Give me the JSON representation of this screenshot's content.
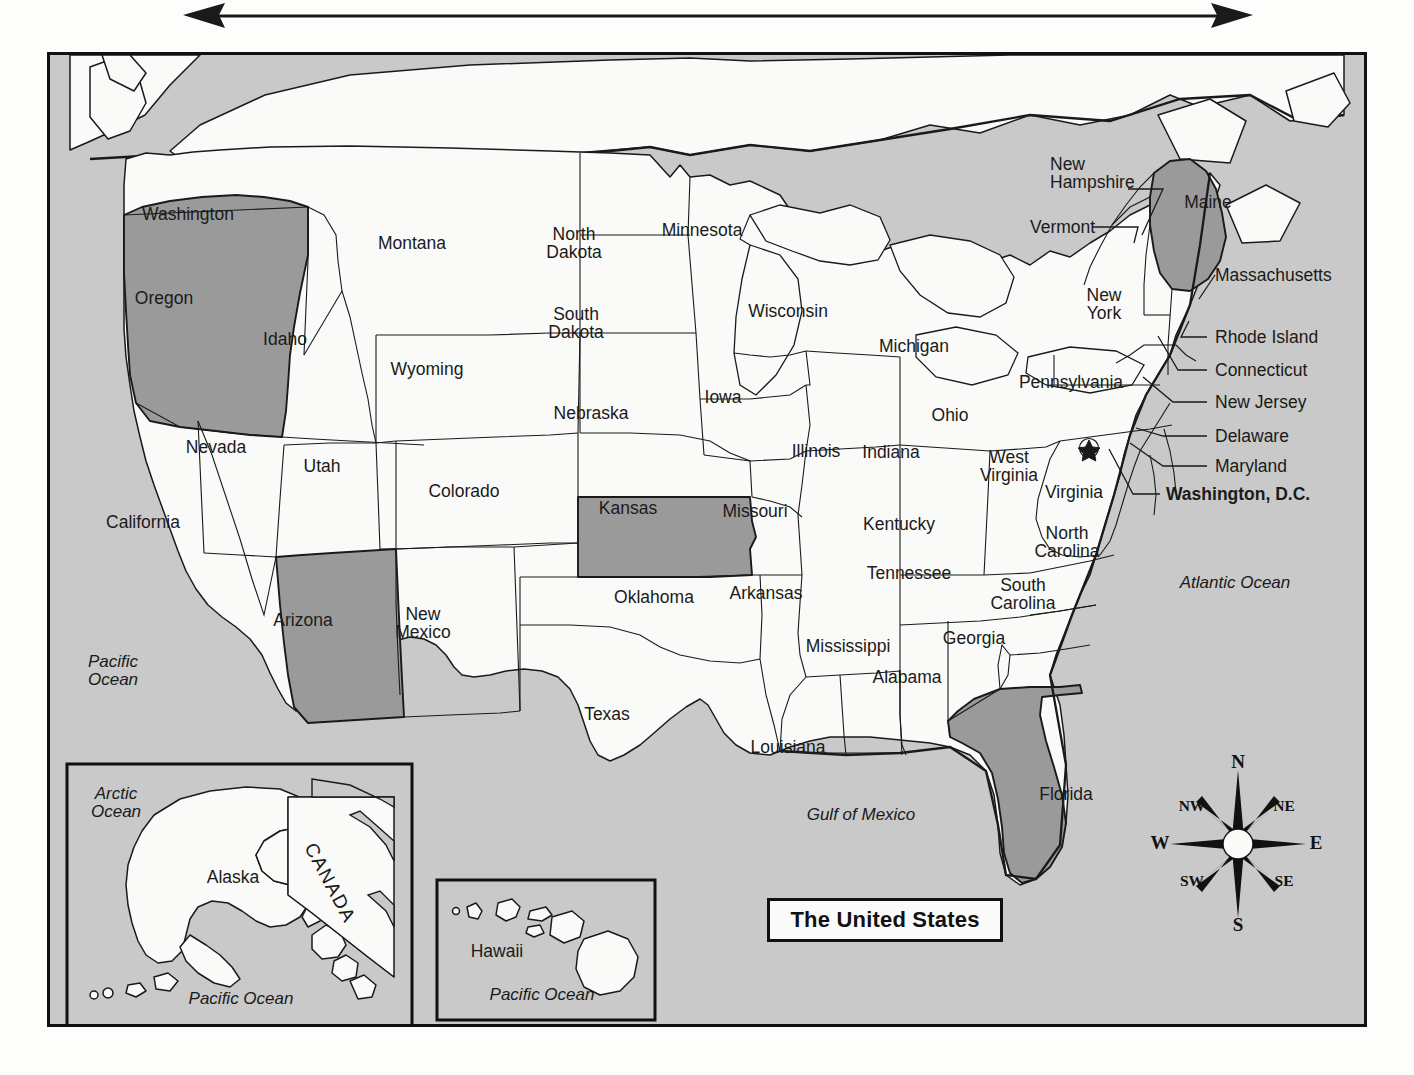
{
  "title": "The United States",
  "top_arrow": {
    "name": "double-headed-arrow",
    "direction": "horizontal-both"
  },
  "colors": {
    "ocean": "#c9c9c9",
    "land": "#fafaf8",
    "highlight": "#9a9a9a",
    "outline": "#1a1a1a",
    "border": "#111111"
  },
  "highlighted_states": [
    "Oregon",
    "Arizona",
    "Kansas",
    "Maine",
    "Florida"
  ],
  "states": [
    {
      "name": "Washington",
      "label": "Washington",
      "x": 185,
      "y": 211
    },
    {
      "name": "Oregon",
      "label": "Oregon",
      "x": 161,
      "y": 295,
      "highlight": true
    },
    {
      "name": "California",
      "label": "California",
      "x": 140,
      "y": 519
    },
    {
      "name": "Idaho",
      "label": "Idaho",
      "x": 282,
      "y": 336
    },
    {
      "name": "Nevada",
      "label": "Nevada",
      "x": 213,
      "y": 444
    },
    {
      "name": "Utah",
      "label": "Utah",
      "x": 319,
      "y": 463
    },
    {
      "name": "Arizona",
      "label": "Arizona",
      "x": 300,
      "y": 617,
      "highlight": true
    },
    {
      "name": "Montana",
      "label": "Montana",
      "x": 409,
      "y": 240
    },
    {
      "name": "Wyoming",
      "label": "Wyoming",
      "x": 424,
      "y": 366
    },
    {
      "name": "Colorado",
      "label": "Colorado",
      "x": 461,
      "y": 488
    },
    {
      "name": "New Mexico",
      "label": "New\nMexico",
      "x": 420,
      "y": 620
    },
    {
      "name": "North Dakota",
      "label": "North\nDakota",
      "x": 571,
      "y": 240
    },
    {
      "name": "South Dakota",
      "label": "South\nDakota",
      "x": 573,
      "y": 320
    },
    {
      "name": "Nebraska",
      "label": "Nebraska",
      "x": 588,
      "y": 410
    },
    {
      "name": "Kansas",
      "label": "Kansas",
      "x": 625,
      "y": 505,
      "highlight": true
    },
    {
      "name": "Oklahoma",
      "label": "Oklahoma",
      "x": 651,
      "y": 594
    },
    {
      "name": "Texas",
      "label": "Texas",
      "x": 604,
      "y": 711
    },
    {
      "name": "Minnesota",
      "label": "Minnesota",
      "x": 699,
      "y": 227
    },
    {
      "name": "Iowa",
      "label": "Iowa",
      "x": 720,
      "y": 394
    },
    {
      "name": "Missouri",
      "label": "Missouri",
      "x": 752,
      "y": 508
    },
    {
      "name": "Arkansas",
      "label": "Arkansas",
      "x": 763,
      "y": 590
    },
    {
      "name": "Louisiana",
      "label": "Louisiana",
      "x": 785,
      "y": 744
    },
    {
      "name": "Wisconsin",
      "label": "Wisconsin",
      "x": 785,
      "y": 308
    },
    {
      "name": "Illinois",
      "label": "Illinois",
      "x": 813,
      "y": 448
    },
    {
      "name": "Mississippi",
      "label": "Mississippi",
      "x": 845,
      "y": 643
    },
    {
      "name": "Michigan",
      "label": "Michigan",
      "x": 911,
      "y": 343
    },
    {
      "name": "Indiana",
      "label": "Indiana",
      "x": 888,
      "y": 449
    },
    {
      "name": "Alabama",
      "label": "Alabama",
      "x": 904,
      "y": 674
    },
    {
      "name": "Kentucky",
      "label": "Kentucky",
      "x": 896,
      "y": 521
    },
    {
      "name": "Tennessee",
      "label": "Tennessee",
      "x": 906,
      "y": 570
    },
    {
      "name": "Ohio",
      "label": "Ohio",
      "x": 947,
      "y": 412
    },
    {
      "name": "West Virginia",
      "label": "West\nVirginia",
      "x": 1006,
      "y": 463
    },
    {
      "name": "Virginia",
      "label": "Virginia",
      "x": 1071,
      "y": 489
    },
    {
      "name": "North Carolina",
      "label": "North\nCarolina",
      "x": 1064,
      "y": 539
    },
    {
      "name": "South Carolina",
      "label": "South\nCarolina",
      "x": 1020,
      "y": 591
    },
    {
      "name": "Georgia",
      "label": "Georgia",
      "x": 971,
      "y": 635
    },
    {
      "name": "Florida",
      "label": "Florida",
      "x": 1063,
      "y": 791,
      "highlight": true
    },
    {
      "name": "Pennsylvania",
      "label": "Pennsylvania",
      "x": 1068,
      "y": 379
    },
    {
      "name": "New York",
      "label": "New\nYork",
      "x": 1101,
      "y": 301
    },
    {
      "name": "Maine",
      "label": "Maine",
      "x": 1205,
      "y": 199,
      "highlight": true
    }
  ],
  "callouts": [
    {
      "name": "new-hampshire",
      "label": "New\nHampshire",
      "text_x": 1047,
      "text_y": 170,
      "lx1": 1125,
      "ly1": 186,
      "lx2": 1160,
      "ly2": 186,
      "lx3": 1139,
      "ly3": 232
    },
    {
      "name": "vermont",
      "label": "Vermont",
      "text_x": 1027,
      "text_y": 224,
      "lx1": 1090,
      "ly1": 224,
      "lx2": 1135,
      "ly2": 224,
      "lx3": 1131,
      "ly3": 240
    },
    {
      "name": "massachusetts",
      "label": "Massachusetts",
      "text_x": 1212,
      "text_y": 272,
      "lx1": 1205,
      "ly1": 272,
      "lx2": 1196,
      "ly2": 296,
      "lx3": 1196,
      "ly3": 296
    },
    {
      "name": "rhode-island",
      "label": "Rhode Island",
      "text_x": 1212,
      "text_y": 334,
      "lx1": 1204,
      "ly1": 334,
      "lx2": 1178,
      "ly2": 334,
      "lx3": 1186,
      "ly3": 318
    },
    {
      "name": "connecticut",
      "label": "Connecticut",
      "text_x": 1212,
      "text_y": 367,
      "lx1": 1204,
      "ly1": 367,
      "lx2": 1175,
      "ly2": 367,
      "lx3": 1155,
      "ly3": 333
    },
    {
      "name": "new-jersey",
      "label": "New Jersey",
      "text_x": 1212,
      "text_y": 399,
      "lx1": 1204,
      "ly1": 399,
      "lx2": 1170,
      "ly2": 399,
      "lx3": 1140,
      "ly3": 374
    },
    {
      "name": "delaware",
      "label": "Delaware",
      "text_x": 1212,
      "text_y": 433,
      "lx1": 1204,
      "ly1": 433,
      "lx2": 1160,
      "ly2": 433,
      "lx3": 1133,
      "ly3": 425
    },
    {
      "name": "maryland",
      "label": "Maryland",
      "text_x": 1212,
      "text_y": 463,
      "lx1": 1204,
      "ly1": 463,
      "lx2": 1160,
      "ly2": 463,
      "lx3": 1127,
      "ly3": 440
    },
    {
      "name": "washington-dc",
      "label": "Washington, D.C.",
      "text_x": 1163,
      "text_y": 491,
      "lx1": 1157,
      "ly1": 491,
      "lx2": 1130,
      "ly2": 491,
      "lx3": 1106,
      "ly3": 446,
      "bold": true
    }
  ],
  "oceans": [
    {
      "name": "pacific-ocean-west",
      "label": "Pacific\nOcean",
      "x": 110,
      "y": 668
    },
    {
      "name": "gulf-of-mexico",
      "label": "Gulf of Mexico",
      "x": 858,
      "y": 812
    },
    {
      "name": "atlantic-ocean",
      "label": "Atlantic Ocean",
      "x": 1232,
      "y": 580
    }
  ],
  "dc_marker": {
    "name": "washington-dc-star",
    "x": 1086,
    "y": 437
  },
  "insets": [
    {
      "name": "alaska-inset",
      "x": 64,
      "y": 761,
      "w": 345,
      "h": 263,
      "labels": [
        {
          "name": "arctic-ocean-label",
          "label": "Arctic\nOcean",
          "x": 113,
          "y": 800,
          "style": "ocean"
        },
        {
          "name": "alaska-label",
          "label": "Alaska",
          "x": 230,
          "y": 874,
          "style": "state"
        },
        {
          "name": "canada-label",
          "label": "CANADA",
          "x": 327,
          "y": 880,
          "style": "canada",
          "rotate": 62
        },
        {
          "name": "pacific-ocean-label",
          "label": "Pacific Ocean",
          "x": 238,
          "y": 996,
          "style": "ocean"
        }
      ]
    },
    {
      "name": "hawaii-inset",
      "x": 432,
      "y": 876,
      "w": 218,
      "h": 140,
      "labels": [
        {
          "name": "hawaii-label",
          "label": "Hawaii",
          "x": 494,
          "y": 948,
          "style": "state"
        },
        {
          "name": "pacific-ocean-label",
          "label": "Pacific Ocean",
          "x": 539,
          "y": 992,
          "style": "ocean"
        }
      ]
    }
  ],
  "compass": {
    "name": "compass-rose",
    "directions": [
      {
        "name": "north",
        "label": "N",
        "x": 90,
        "y": 14,
        "diag": false
      },
      {
        "name": "northeast",
        "label": "NE",
        "x": 136,
        "y": 58,
        "diag": true
      },
      {
        "name": "east",
        "label": "E",
        "x": 168,
        "y": 95,
        "diag": false
      },
      {
        "name": "southeast",
        "label": "SE",
        "x": 136,
        "y": 133,
        "diag": true
      },
      {
        "name": "south",
        "label": "S",
        "x": 90,
        "y": 177,
        "diag": false
      },
      {
        "name": "southwest",
        "label": "SW",
        "x": 44,
        "y": 133,
        "diag": true
      },
      {
        "name": "west",
        "label": "W",
        "x": 12,
        "y": 95,
        "diag": false
      },
      {
        "name": "northwest",
        "label": "NW",
        "x": 44,
        "y": 58,
        "diag": true
      }
    ]
  }
}
